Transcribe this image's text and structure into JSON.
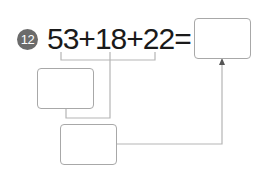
{
  "problem": {
    "number": "12",
    "expression": "53+18+22=",
    "terms": [
      "53",
      "18",
      "22"
    ],
    "operator": "+",
    "equals": "="
  },
  "answer_boxes": {
    "result": "",
    "partial_sum_first": "",
    "partial_sum_second": ""
  },
  "colors": {
    "badge": "#6b6b6b",
    "text": "#1a1a1a",
    "box_border": "#a8a8a8",
    "line": "#b5b5b5"
  }
}
